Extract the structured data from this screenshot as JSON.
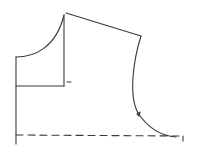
{
  "diagram": {
    "type": "pattern-draft",
    "colors": {
      "line": "#3a3a3a",
      "background": "#ffffff"
    },
    "elements": [
      {
        "name": "center-line",
        "style": "solid"
      },
      {
        "name": "neckline-curve",
        "style": "solid"
      },
      {
        "name": "neck-depth-line",
        "style": "solid"
      },
      {
        "name": "neck-width-line",
        "style": "solid"
      },
      {
        "name": "shoulder-line",
        "style": "solid"
      },
      {
        "name": "armhole-curve",
        "style": "solid"
      },
      {
        "name": "armhole-notch",
        "style": "solid"
      },
      {
        "name": "waist-guide-line",
        "style": "dashed"
      },
      {
        "name": "side-seam-end",
        "style": "solid"
      }
    ]
  }
}
